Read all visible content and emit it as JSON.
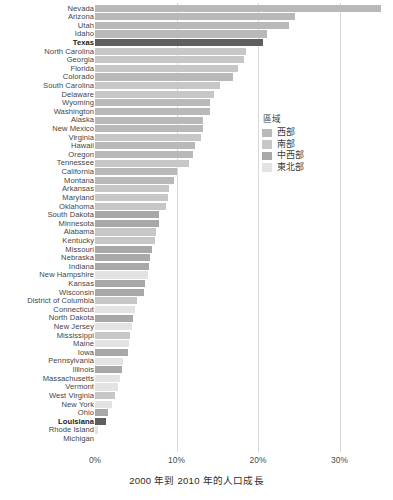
{
  "chart_data": {
    "type": "bar",
    "orientation": "horizontal",
    "title": "",
    "xlabel": "2000 年到 2010 年的人口成長",
    "ylabel": "",
    "xlim": [
      -1,
      36
    ],
    "xticks": [
      0,
      10,
      20,
      30
    ],
    "xticklabels": [
      "0%",
      "10%",
      "20%",
      "30%"
    ],
    "grid": "vertical",
    "legend": {
      "title": "區域",
      "position": "center-right",
      "entries": [
        {
          "label": "西部",
          "key": "west",
          "color": "#b9b9b9"
        },
        {
          "label": "南部",
          "key": "south",
          "color": "#c7c7c7"
        },
        {
          "label": "中西部",
          "key": "midwest",
          "color": "#a8a8a8"
        },
        {
          "label": "東北部",
          "key": "northeast",
          "color": "#e3e3e3"
        }
      ]
    },
    "highlight_color": "#5e5e5e",
    "highlighted": [
      "Texas",
      "Louisiana"
    ],
    "categories": [
      "Nevada",
      "Arizona",
      "Utah",
      "Idaho",
      "Texas",
      "North Carolina",
      "Georgia",
      "Florida",
      "Colorado",
      "South Carolina",
      "Delaware",
      "Wyoming",
      "Washington",
      "Alaska",
      "New Mexico",
      "Virginia",
      "Hawaii",
      "Oregon",
      "Tennessee",
      "California",
      "Montana",
      "Arkansas",
      "Maryland",
      "Oklahoma",
      "South Dakota",
      "Minnesota",
      "Alabama",
      "Kentucky",
      "Missouri",
      "Nebraska",
      "Indiana",
      "New Hampshire",
      "Kansas",
      "Wisconsin",
      "District of Columbia",
      "Connecticut",
      "North Dakota",
      "New Jersey",
      "Mississippi",
      "Maine",
      "Iowa",
      "Pennsylvania",
      "Illinois",
      "Massachusetts",
      "Vermont",
      "West Virginia",
      "New York",
      "Ohio",
      "Louisiana",
      "Rhode Island",
      "Michigan"
    ],
    "values": [
      35.1,
      24.6,
      23.8,
      21.1,
      20.6,
      18.5,
      18.3,
      17.6,
      16.9,
      15.3,
      14.6,
      14.1,
      14.1,
      13.3,
      13.2,
      13.0,
      12.3,
      12.0,
      11.5,
      10.0,
      9.7,
      9.1,
      9.0,
      8.7,
      7.9,
      7.8,
      7.5,
      7.4,
      7.0,
      6.7,
      6.6,
      6.5,
      6.1,
      6.0,
      5.2,
      4.9,
      4.7,
      4.5,
      4.3,
      4.2,
      4.1,
      3.4,
      3.3,
      3.1,
      2.8,
      2.5,
      2.1,
      1.6,
      1.4,
      0.4,
      -0.6
    ],
    "regions": [
      "west",
      "west",
      "west",
      "west",
      "south",
      "south",
      "south",
      "south",
      "west",
      "south",
      "south",
      "west",
      "west",
      "west",
      "west",
      "south",
      "west",
      "west",
      "south",
      "west",
      "west",
      "south",
      "south",
      "south",
      "midwest",
      "midwest",
      "south",
      "south",
      "midwest",
      "midwest",
      "midwest",
      "northeast",
      "midwest",
      "midwest",
      "south",
      "northeast",
      "midwest",
      "northeast",
      "south",
      "northeast",
      "midwest",
      "northeast",
      "midwest",
      "northeast",
      "northeast",
      "south",
      "northeast",
      "midwest",
      "south",
      "northeast",
      "midwest"
    ]
  }
}
